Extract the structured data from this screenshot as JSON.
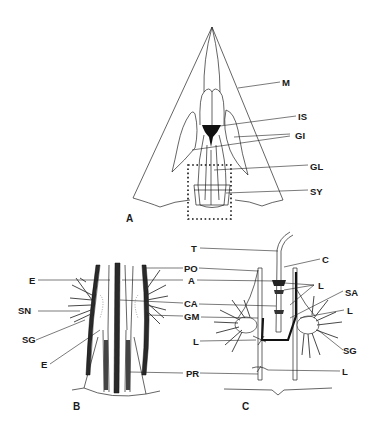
{
  "figure": {
    "panels": [
      {
        "id": "A",
        "label": "A",
        "labels": [
          {
            "text": "M"
          },
          {
            "text": "IS"
          },
          {
            "text": "GI"
          },
          {
            "text": "GL"
          },
          {
            "text": "SY"
          }
        ]
      },
      {
        "id": "B",
        "label": "B",
        "labels_left": [
          {
            "text": "E"
          },
          {
            "text": "SN"
          },
          {
            "text": "SG"
          },
          {
            "text": "E"
          }
        ],
        "labels_center": [
          {
            "text": "PO"
          },
          {
            "text": "A"
          },
          {
            "text": "CA"
          },
          {
            "text": "GM"
          },
          {
            "text": "PR"
          }
        ]
      },
      {
        "id": "C",
        "label": "C",
        "labels_left": [
          {
            "text": "T"
          },
          {
            "text": "L"
          }
        ],
        "labels_right": [
          {
            "text": "C"
          },
          {
            "text": "L"
          },
          {
            "text": "SA"
          },
          {
            "text": "L"
          },
          {
            "text": "SG"
          },
          {
            "text": "L"
          }
        ]
      }
    ]
  }
}
